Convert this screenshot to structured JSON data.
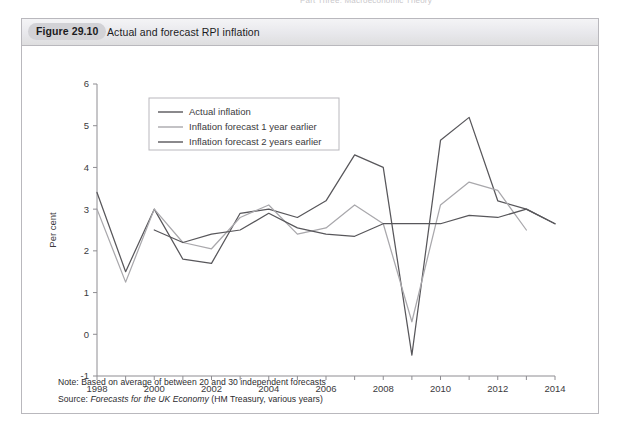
{
  "page": {
    "running_header": "Part Three: Macroeconomic Theory"
  },
  "figure": {
    "number_label": "Figure 29.10",
    "caption": "Actual and forecast RPI inflation",
    "note": "Note: Based on average of between 20 and 30 independent forecasts",
    "source_prefix": "Source: ",
    "source_italic": "Forecasts for the UK Economy",
    "source_suffix": " (HM Treasury, various years)"
  },
  "colors": {
    "actual": "#58575b",
    "forecast_1y": "#a9a8ac",
    "forecast_2y": "#58575b",
    "axis": "#8e8d92",
    "header_pill": "#d2d2d6",
    "frame": "#b9b8bd",
    "text": "#231f20"
  },
  "chart_data": {
    "type": "line",
    "title": "Actual and forecast RPI inflation",
    "xlabel": "",
    "ylabel": "Per cent",
    "xlim": [
      1998,
      2014
    ],
    "ylim": [
      -1,
      6
    ],
    "grid": false,
    "legend_position": "top-left inside",
    "y_ticks": [
      -1,
      0,
      1,
      2,
      3,
      4,
      5,
      6
    ],
    "y_ticklabels": [
      "-1",
      "0",
      "1",
      "2",
      "3",
      "4",
      "5",
      "6"
    ],
    "x_ticks": [
      1998,
      1999,
      2000,
      2001,
      2002,
      2003,
      2004,
      2005,
      2006,
      2007,
      2008,
      2009,
      2010,
      2011,
      2012,
      2013,
      2014
    ],
    "x_ticklabels": [
      "1998",
      "",
      "2000",
      "",
      "2002",
      "",
      "2004",
      "",
      "2006",
      "",
      "2008",
      "",
      "2010",
      "",
      "2012",
      "",
      "2014"
    ],
    "series": [
      {
        "name": "Actual inflation",
        "color": "#58575b",
        "x": [
          1998,
          1999,
          2000,
          2001,
          2002,
          2003,
          2004,
          2005,
          2006,
          2007,
          2008,
          2009,
          2010,
          2011,
          2012,
          2013,
          2014
        ],
        "values": [
          3.4,
          1.5,
          3.0,
          1.8,
          1.7,
          2.9,
          3.0,
          2.8,
          3.2,
          4.3,
          4.0,
          -0.5,
          4.65,
          5.2,
          3.2,
          3.0,
          2.65
        ]
      },
      {
        "name": "Inflation forecast 1 year earlier",
        "color": "#a9a8ac",
        "x": [
          1998,
          1999,
          2000,
          2001,
          2002,
          2003,
          2004,
          2005,
          2006,
          2007,
          2008,
          2009,
          2010,
          2011,
          2012,
          2013
        ],
        "values": [
          3.0,
          1.25,
          3.0,
          2.2,
          2.05,
          2.8,
          3.1,
          2.4,
          2.55,
          3.1,
          2.65,
          0.3,
          3.1,
          3.65,
          3.45,
          2.5
        ]
      },
      {
        "name": "Inflation forecast 2 years earlier",
        "color": "#58575b",
        "x": [
          2000,
          2001,
          2002,
          2003,
          2004,
          2005,
          2006,
          2007,
          2008,
          2009,
          2010,
          2011,
          2012,
          2013,
          2014
        ],
        "values": [
          2.5,
          2.2,
          2.4,
          2.5,
          2.9,
          2.55,
          2.4,
          2.35,
          2.65,
          2.65,
          2.65,
          2.85,
          2.8,
          3.0,
          2.65
        ]
      }
    ]
  }
}
